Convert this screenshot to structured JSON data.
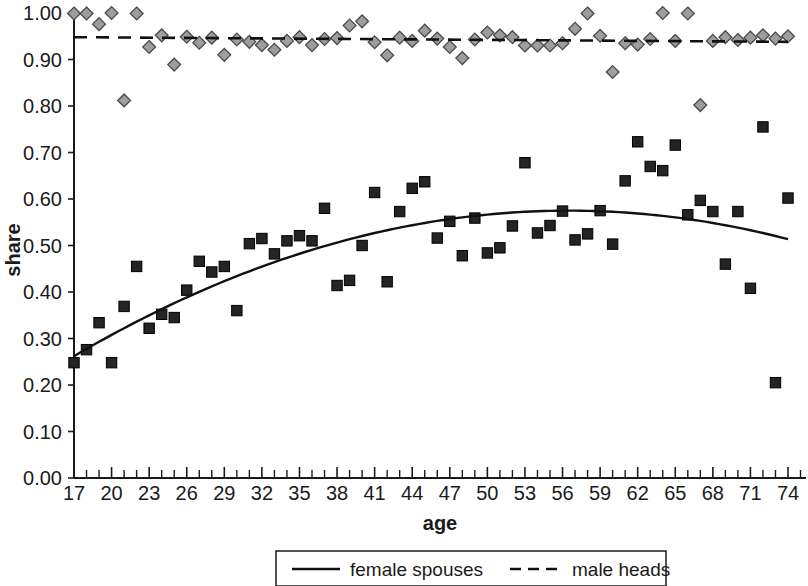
{
  "chart_data": {
    "type": "scatter",
    "title": "",
    "xlabel": "age",
    "ylabel": "share",
    "xlim": [
      17,
      75
    ],
    "ylim": [
      0.0,
      1.0
    ],
    "grid": false,
    "legend_position": "bottom-center",
    "x_ticks_labeled": [
      17,
      20,
      23,
      26,
      29,
      32,
      35,
      38,
      41,
      44,
      47,
      50,
      53,
      56,
      59,
      62,
      65,
      68,
      71,
      74
    ],
    "x_tick_labels": [
      "17",
      "20",
      "23",
      "26",
      "29",
      "32",
      "35",
      "38",
      "41",
      "44",
      "47",
      "50",
      "53",
      "56",
      "59",
      "62",
      "65",
      "68",
      "71",
      "74"
    ],
    "x_tick_step_minor": 1,
    "y_ticks": [
      0.0,
      0.1,
      0.2,
      0.3,
      0.4,
      0.5,
      0.6,
      0.7,
      0.8,
      0.9,
      1.0
    ],
    "y_tick_labels": [
      "0.00",
      "0.10",
      "0.20",
      "0.30",
      "0.40",
      "0.50",
      "0.60",
      "0.70",
      "0.80",
      "0.90",
      "1.00"
    ],
    "series": [
      {
        "name": "female spouses",
        "marker": "square",
        "marker_color": "#242424",
        "fit": "quadratic",
        "fit_style": "solid",
        "x": [
          17,
          18,
          19,
          20,
          21,
          22,
          23,
          24,
          25,
          26,
          27,
          28,
          29,
          30,
          31,
          32,
          33,
          34,
          35,
          36,
          37,
          38,
          39,
          40,
          41,
          42,
          43,
          44,
          45,
          46,
          47,
          48,
          49,
          50,
          51,
          52,
          53,
          54,
          55,
          56,
          57,
          58,
          59,
          60,
          61,
          62,
          63,
          64,
          65,
          66,
          67,
          68,
          69,
          70,
          71,
          72,
          73,
          74
        ],
        "y": [
          0.248,
          0.276,
          0.334,
          0.248,
          0.369,
          0.455,
          0.322,
          0.352,
          0.345,
          0.404,
          0.466,
          0.443,
          0.455,
          0.36,
          0.504,
          0.515,
          0.482,
          0.51,
          0.521,
          0.51,
          0.58,
          0.414,
          0.425,
          0.5,
          0.614,
          0.422,
          0.573,
          0.623,
          0.637,
          0.516,
          0.552,
          0.478,
          0.559,
          0.484,
          0.495,
          0.542,
          0.678,
          0.527,
          0.543,
          0.574,
          0.512,
          0.525,
          0.575,
          0.503,
          0.639,
          0.723,
          0.67,
          0.661,
          0.716,
          0.566,
          0.597,
          0.573,
          0.46,
          0.573,
          0.408,
          0.755,
          0.205,
          0.602
        ]
      },
      {
        "name": "male heads",
        "marker": "diamond",
        "marker_color": "#9d9d9d",
        "fit": "linear",
        "fit_style": "dashed",
        "x": [
          17,
          18,
          19,
          20,
          21,
          22,
          23,
          24,
          25,
          26,
          27,
          28,
          29,
          30,
          31,
          32,
          33,
          34,
          35,
          36,
          37,
          38,
          39,
          40,
          41,
          42,
          43,
          44,
          45,
          46,
          47,
          48,
          49,
          50,
          51,
          52,
          53,
          54,
          55,
          56,
          57,
          58,
          59,
          60,
          61,
          62,
          63,
          64,
          65,
          66,
          67,
          68,
          69,
          70,
          71,
          72,
          73,
          74
        ],
        "y": [
          0.999,
          0.999,
          0.976,
          1.0,
          0.812,
          0.999,
          0.927,
          0.952,
          0.889,
          0.949,
          0.936,
          0.947,
          0.91,
          0.943,
          0.938,
          0.931,
          0.921,
          0.94,
          0.948,
          0.931,
          0.944,
          0.946,
          0.973,
          0.982,
          0.937,
          0.909,
          0.947,
          0.94,
          0.962,
          0.945,
          0.927,
          0.903,
          0.943,
          0.958,
          0.952,
          0.948,
          0.93,
          0.93,
          0.93,
          0.935,
          0.966,
          0.999,
          0.951,
          0.873,
          0.935,
          0.932,
          0.944,
          1.0,
          0.94,
          0.999,
          0.802,
          0.94,
          0.948,
          0.942,
          0.947,
          0.952,
          0.945,
          0.95
        ]
      }
    ],
    "fit_curves": {
      "female_spouses": {
        "style": "solid",
        "peak_age": 56.5,
        "peak_value": 0.575,
        "start": [
          17,
          0.262
        ],
        "end": [
          74,
          0.492
        ]
      },
      "male_heads": {
        "style": "dashed",
        "start": [
          17,
          0.948
        ],
        "end": [
          74,
          0.938
        ]
      }
    }
  },
  "axes": {
    "y_title": "share",
    "x_title": "age"
  },
  "legend": {
    "items": [
      {
        "label": "female spouses",
        "style": "solid"
      },
      {
        "label": "male heads",
        "style": "dashed"
      }
    ]
  }
}
